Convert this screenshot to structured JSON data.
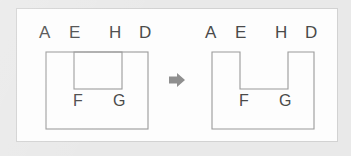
{
  "diagram": {
    "background_color": "#e9e9e9",
    "card_color": "#fdfdfd",
    "stroke_color": "#9a9a9a",
    "label_color": "#4a4a4a",
    "arrow_color": "#8f8f8f",
    "arrow_glyph": "➤",
    "arrow_icon_name": "right-arrow-icon",
    "left_figure": {
      "name": "nested-rectangles-figure",
      "description": "Large outer rectangle with an inner rectangle flush to its top edge",
      "top_labels": [
        {
          "text": "A",
          "x": 22,
          "y": 22
        },
        {
          "text": "E",
          "x": 52,
          "y": 22
        },
        {
          "text": "H",
          "x": 92,
          "y": 22
        },
        {
          "text": "D",
          "x": 122,
          "y": 22
        }
      ],
      "inner_labels": [
        {
          "text": "F",
          "x": 56,
          "y": 82
        },
        {
          "text": "G",
          "x": 96,
          "y": 82
        }
      ],
      "outer_rect": {
        "x": 29,
        "y": 43,
        "width": 102,
        "height": 77
      },
      "inner_rect": {
        "x": 57,
        "y": 43,
        "width": 48,
        "height": 37
      }
    },
    "right_figure": {
      "name": "u-shape-figure",
      "description": "U-shaped polygon formed by removing the inner rectangle notch from the top",
      "top_labels": [
        {
          "text": "A",
          "x": 188,
          "y": 22
        },
        {
          "text": "E",
          "x": 218,
          "y": 22
        },
        {
          "text": "H",
          "x": 258,
          "y": 22
        },
        {
          "text": "D",
          "x": 288,
          "y": 22
        }
      ],
      "inner_labels": [
        {
          "text": "F",
          "x": 222,
          "y": 82
        },
        {
          "text": "G",
          "x": 262,
          "y": 82
        }
      ],
      "outline": "M195,43 L223,43 L223,80 L271,80 L271,43 L297,43 L297,120 L195,120 Z"
    }
  }
}
